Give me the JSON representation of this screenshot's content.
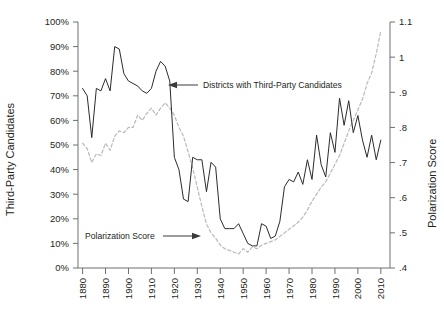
{
  "chart_data": {
    "type": "line",
    "title": "",
    "xlabel": "",
    "ylabel": "Third-Party Candidates",
    "y2label": "Polarization Score",
    "grid": false,
    "legend_position": "inline-annotations",
    "xlim": [
      1878,
      2014
    ],
    "ylim": [
      0,
      100
    ],
    "y2lim": [
      0.4,
      1.1
    ],
    "xticks": [
      1880,
      1890,
      1900,
      1910,
      1920,
      1930,
      1940,
      1950,
      1960,
      1970,
      1980,
      1990,
      2000,
      2010
    ],
    "xtick_labels": [
      "1880",
      "1890",
      "1900",
      "1910",
      "1920",
      "1930",
      "1940",
      "1950",
      "1960",
      "1970",
      "1980",
      "1990",
      "2000",
      "2010"
    ],
    "yticks": [
      0,
      10,
      20,
      30,
      40,
      50,
      60,
      70,
      80,
      90,
      100
    ],
    "ytick_labels": [
      "0%",
      "10%",
      "20%",
      "30%",
      "40%",
      "50%",
      "60%",
      "70%",
      "80%",
      "90%",
      "100%"
    ],
    "y2ticks": [
      0.4,
      0.5,
      0.6,
      0.7,
      0.8,
      0.9,
      1.0,
      1.1
    ],
    "y2tick_labels": [
      ".4",
      ".5",
      ".6",
      ".7",
      ".8",
      ".9",
      "1",
      "1.1"
    ],
    "annotations": [
      {
        "name": "districts-annotation",
        "text": "Districts with Third-Party Candidates",
        "arrow": "left"
      },
      {
        "name": "polarization-annotation",
        "text": "Polarization Score",
        "arrow": "right"
      }
    ],
    "series": [
      {
        "name": "Districts with Third-Party Candidates",
        "axis": "left",
        "style": "solid",
        "color": "#2b2b2b",
        "x": [
          1880,
          1882,
          1884,
          1886,
          1888,
          1890,
          1892,
          1894,
          1896,
          1898,
          1900,
          1902,
          1904,
          1906,
          1908,
          1910,
          1912,
          1914,
          1916,
          1918,
          1920,
          1922,
          1924,
          1926,
          1928,
          1930,
          1932,
          1934,
          1936,
          1938,
          1940,
          1942,
          1944,
          1946,
          1948,
          1950,
          1952,
          1954,
          1956,
          1958,
          1960,
          1962,
          1964,
          1966,
          1968,
          1970,
          1972,
          1974,
          1976,
          1978,
          1980,
          1982,
          1984,
          1986,
          1988,
          1990,
          1992,
          1994,
          1996,
          1998,
          2000,
          2002,
          2004,
          2006,
          2008,
          2010
        ],
        "y": [
          73,
          70,
          53,
          73,
          72,
          77,
          72,
          90,
          89,
          79,
          76,
          75,
          74,
          72,
          71,
          73,
          80,
          84,
          82,
          76,
          45,
          40,
          28,
          27,
          45,
          44,
          44,
          31,
          43,
          41,
          20,
          16,
          16,
          16,
          18,
          14,
          10,
          9,
          9,
          18,
          17,
          12,
          13,
          19,
          33,
          36,
          35,
          39,
          34,
          44,
          36,
          54,
          42,
          37,
          55,
          47,
          69,
          58,
          68,
          55,
          62,
          52,
          45,
          54,
          44,
          52
        ]
      },
      {
        "name": "Polarization Score",
        "axis": "right",
        "style": "dashed",
        "color": "#b9b9b9",
        "x": [
          1880,
          1882,
          1884,
          1886,
          1888,
          1890,
          1892,
          1894,
          1896,
          1898,
          1900,
          1902,
          1904,
          1906,
          1908,
          1910,
          1912,
          1914,
          1916,
          1918,
          1920,
          1922,
          1924,
          1926,
          1928,
          1930,
          1932,
          1934,
          1936,
          1938,
          1940,
          1942,
          1944,
          1946,
          1948,
          1950,
          1952,
          1954,
          1956,
          1958,
          1960,
          1962,
          1964,
          1966,
          1968,
          1970,
          1972,
          1974,
          1976,
          1978,
          1980,
          1982,
          1984,
          1986,
          1988,
          1990,
          1992,
          1994,
          1996,
          1998,
          2000,
          2002,
          2004,
          2006,
          2008,
          2010
        ],
        "y": [
          0.755,
          0.74,
          0.7,
          0.725,
          0.72,
          0.755,
          0.735,
          0.775,
          0.79,
          0.785,
          0.8,
          0.8,
          0.835,
          0.82,
          0.84,
          0.855,
          0.835,
          0.855,
          0.87,
          0.855,
          0.835,
          0.8,
          0.775,
          0.73,
          0.685,
          0.63,
          0.575,
          0.525,
          0.5,
          0.485,
          0.465,
          0.455,
          0.45,
          0.445,
          0.44,
          0.455,
          0.445,
          0.46,
          0.455,
          0.465,
          0.47,
          0.475,
          0.48,
          0.49,
          0.5,
          0.51,
          0.52,
          0.53,
          0.545,
          0.565,
          0.59,
          0.61,
          0.63,
          0.645,
          0.67,
          0.695,
          0.72,
          0.755,
          0.79,
          0.82,
          0.85,
          0.88,
          0.925,
          0.955,
          1.01,
          1.075
        ]
      }
    ]
  },
  "axis": {
    "left_title": "Third-Party Candidates",
    "right_title": "Polarization Score"
  },
  "annotations": {
    "districts_text": "Districts with Third-Party Candidates",
    "polarization_text": "Polarization Score"
  },
  "colors": {
    "solid_series": "#2b2b2b",
    "dashed_series": "#b9b9b9",
    "axis": "#6d6e71",
    "text": "#231f20"
  }
}
